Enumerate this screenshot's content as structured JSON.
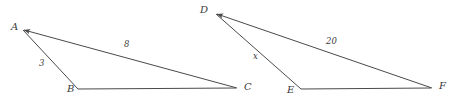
{
  "diagram": {
    "background_color": "#ffffff",
    "stroke_color": "#4a4a4a",
    "label_color": "#3a3a3a",
    "figures": [
      {
        "name": "triangle-abc",
        "vertices": [
          {
            "id": "A",
            "label": "A",
            "x": 23,
            "y": 30,
            "label_x": 11,
            "label_y": 22
          },
          {
            "id": "B",
            "label": "B",
            "x": 78,
            "y": 89,
            "label_x": 67,
            "label_y": 84
          },
          {
            "id": "C",
            "label": "C",
            "x": 237,
            "y": 88,
            "label_x": 244,
            "label_y": 82
          }
        ],
        "sides": [
          {
            "from": "A",
            "to": "B",
            "measure": "3",
            "label_x": 39,
            "label_y": 59
          },
          {
            "from": "A",
            "to": "C",
            "measure": "8",
            "label_x": 124,
            "label_y": 40
          },
          {
            "from": "B",
            "to": "C",
            "measure": "",
            "label_x": 0,
            "label_y": 0
          }
        ]
      },
      {
        "name": "triangle-def",
        "vertices": [
          {
            "id": "D",
            "label": "D",
            "x": 216,
            "y": 14,
            "label_x": 200,
            "label_y": 5
          },
          {
            "id": "E",
            "label": "E",
            "x": 301,
            "y": 89,
            "label_x": 287,
            "label_y": 85
          },
          {
            "id": "F",
            "label": "F",
            "x": 432,
            "y": 88,
            "label_x": 439,
            "label_y": 81
          }
        ],
        "sides": [
          {
            "from": "D",
            "to": "E",
            "measure": "x",
            "label_x": 253,
            "label_y": 52
          },
          {
            "from": "D",
            "to": "F",
            "measure": "20",
            "label_x": 326,
            "label_y": 37
          },
          {
            "from": "E",
            "to": "F",
            "measure": "",
            "label_x": 0,
            "label_y": 0
          }
        ]
      }
    ]
  }
}
